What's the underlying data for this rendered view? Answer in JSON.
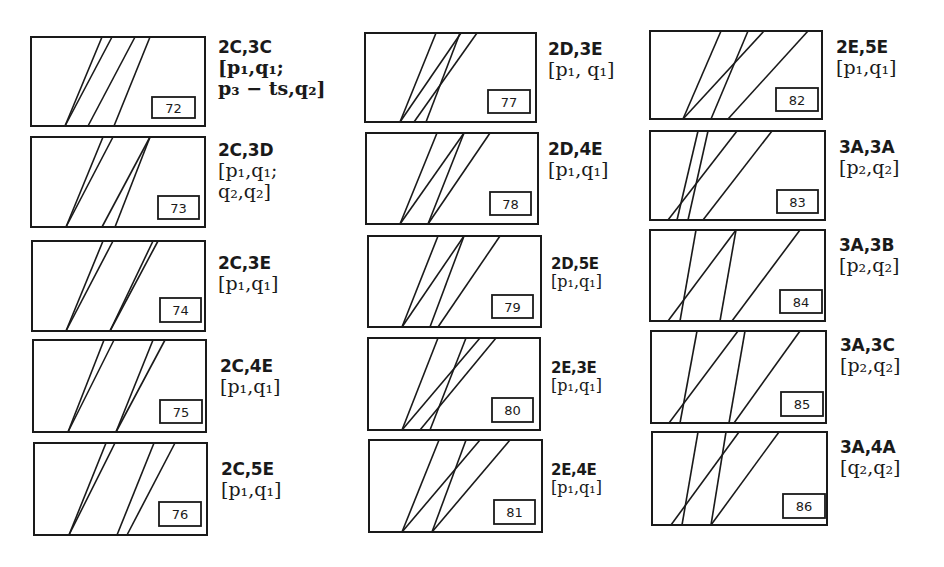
{
  "figure": {
    "background": "#ffffff",
    "stroke_color": "#1a1a1a"
  },
  "panels": [
    {
      "number": "72",
      "box": [
        31,
        37,
        205,
        126
      ],
      "numbox": [
        152,
        97,
        195,
        118
      ],
      "lines": [
        [
          65,
          126,
          102,
          37
        ],
        [
          65,
          126,
          112,
          37
        ],
        [
          88,
          126,
          135,
          37
        ],
        [
          114,
          126,
          150,
          37
        ]
      ],
      "label": {
        "x": 218,
        "y": 38,
        "code": "2C,3C",
        "params": [
          "[p₁,q₁;",
          "p₃ − ts,q₂]"
        ],
        "style": "bold"
      }
    },
    {
      "number": "73",
      "box": [
        31,
        137,
        205,
        227
      ],
      "numbox": [
        158,
        196,
        199,
        219
      ],
      "lines": [
        [
          66,
          227,
          103,
          137
        ],
        [
          66,
          227,
          113,
          137
        ],
        [
          102,
          227,
          150,
          137
        ],
        [
          115,
          227,
          150,
          137
        ]
      ],
      "label": {
        "x": 218,
        "y": 141,
        "code": "2C,3D",
        "params": [
          "[p₁,q₁;",
          "q₂,q₂]"
        ],
        "style": "normal"
      }
    },
    {
      "number": "74",
      "box": [
        32,
        241,
        205,
        331
      ],
      "numbox": [
        160,
        298,
        201,
        322
      ],
      "lines": [
        [
          66,
          331,
          103,
          241
        ],
        [
          66,
          331,
          113,
          241
        ],
        [
          110,
          331,
          153,
          241
        ],
        [
          110,
          331,
          158,
          241
        ]
      ],
      "label": {
        "x": 218,
        "y": 254,
        "code": "2C,3E",
        "params": [
          "[p₁,q₁]"
        ],
        "style": "normal"
      }
    },
    {
      "number": "75",
      "box": [
        33,
        340,
        206,
        432
      ],
      "numbox": [
        160,
        400,
        202,
        423
      ],
      "lines": [
        [
          68,
          432,
          104,
          340
        ],
        [
          68,
          432,
          114,
          340
        ],
        [
          116,
          432,
          153,
          340
        ],
        [
          116,
          432,
          165,
          340
        ]
      ],
      "label": {
        "x": 220,
        "y": 357,
        "code": "2C,4E",
        "params": [
          "[p₁,q₁]"
        ],
        "style": "normal"
      }
    },
    {
      "number": "76",
      "box": [
        34,
        443,
        207,
        535
      ],
      "numbox": [
        159,
        502,
        201,
        526
      ],
      "lines": [
        [
          69,
          535,
          106,
          443
        ],
        [
          69,
          535,
          115,
          443
        ],
        [
          117,
          535,
          154,
          443
        ],
        [
          127,
          535,
          175,
          443
        ]
      ],
      "label": {
        "x": 221,
        "y": 460,
        "code": "2C,5E",
        "params": [
          "[p₁,q₁]"
        ],
        "style": "normal"
      }
    },
    {
      "number": "77",
      "box": [
        365,
        33,
        536,
        122
      ],
      "numbox": [
        488,
        90,
        530,
        113
      ],
      "lines": [
        [
          400,
          122,
          436,
          33
        ],
        [
          400,
          122,
          461,
          33
        ],
        [
          414,
          122,
          477,
          33
        ],
        [
          426,
          122,
          460,
          33
        ]
      ],
      "label": {
        "x": 548,
        "y": 40,
        "code": "2D,3E",
        "params": [
          "[p₁, q₁]"
        ],
        "style": "normal"
      }
    },
    {
      "number": "78",
      "box": [
        366,
        133,
        538,
        224
      ],
      "numbox": [
        490,
        192,
        531,
        215
      ],
      "lines": [
        [
          400,
          224,
          437,
          133
        ],
        [
          400,
          224,
          464,
          133
        ],
        [
          428,
          224,
          464,
          133
        ],
        [
          428,
          224,
          490,
          133
        ]
      ],
      "label": {
        "x": 548,
        "y": 140,
        "code": "2D,4E",
        "params": [
          "[p₁,q₁]"
        ],
        "style": "normal"
      }
    },
    {
      "number": "79",
      "box": [
        368,
        236,
        541,
        327
      ],
      "numbox": [
        492,
        295,
        533,
        318
      ],
      "lines": [
        [
          402,
          327,
          438,
          236
        ],
        [
          402,
          327,
          464,
          236
        ],
        [
          430,
          327,
          464,
          236
        ],
        [
          438,
          327,
          500,
          236
        ]
      ],
      "label": {
        "x": 551,
        "y": 256,
        "code": "2D,5E",
        "params": [
          "[p₁,q₁]"
        ],
        "style": "small"
      }
    },
    {
      "number": "80",
      "box": [
        368,
        338,
        540,
        430
      ],
      "numbox": [
        492,
        398,
        533,
        422
      ],
      "lines": [
        [
          402,
          430,
          438,
          338
        ],
        [
          402,
          430,
          480,
          338
        ],
        [
          420,
          430,
          496,
          338
        ],
        [
          430,
          430,
          466,
          338
        ]
      ],
      "label": {
        "x": 551,
        "y": 360,
        "code": "2E,3E",
        "params": [
          "[p₁,q₁]"
        ],
        "style": "small"
      }
    },
    {
      "number": "81",
      "box": [
        369,
        440,
        542,
        532
      ],
      "numbox": [
        494,
        500,
        535,
        524
      ],
      "lines": [
        [
          402,
          532,
          439,
          440
        ],
        [
          402,
          532,
          480,
          440
        ],
        [
          432,
          532,
          466,
          440
        ],
        [
          432,
          532,
          510,
          440
        ]
      ],
      "label": {
        "x": 551,
        "y": 462,
        "code": "2E,4E",
        "params": [
          "[p₁,q₁]"
        ],
        "style": "small"
      }
    },
    {
      "number": "82",
      "box": [
        650,
        31,
        822,
        119
      ],
      "numbox": [
        776,
        88,
        818,
        111
      ],
      "lines": [
        [
          683,
          119,
          721,
          31
        ],
        [
          683,
          119,
          764,
          31
        ],
        [
          711,
          119,
          748,
          31
        ],
        [
          728,
          119,
          808,
          31
        ]
      ],
      "label": {
        "x": 836,
        "y": 38,
        "code": "2E,5E",
        "params": [
          "[p₁,q₁]"
        ],
        "style": "normal"
      }
    },
    {
      "number": "83",
      "box": [
        650,
        131,
        825,
        220
      ],
      "numbox": [
        777,
        190,
        818,
        213
      ],
      "lines": [
        [
          668,
          220,
          737,
          131
        ],
        [
          677,
          220,
          698,
          131
        ],
        [
          688,
          220,
          708,
          131
        ],
        [
          703,
          220,
          772,
          131
        ]
      ],
      "label": {
        "x": 839,
        "y": 138,
        "code": "3A,3A",
        "params": [
          "[p₂,q₂]"
        ],
        "style": "normal"
      }
    },
    {
      "number": "84",
      "box": [
        650,
        230,
        825,
        321
      ],
      "numbox": [
        780,
        290,
        822,
        313
      ],
      "lines": [
        [
          668,
          321,
          736,
          230
        ],
        [
          680,
          321,
          696,
          230
        ],
        [
          720,
          321,
          736,
          230
        ],
        [
          732,
          321,
          800,
          230
        ]
      ],
      "label": {
        "x": 839,
        "y": 236,
        "code": "3A,3B",
        "params": [
          "[p₂,q₂]"
        ],
        "style": "normal"
      }
    },
    {
      "number": "85",
      "box": [
        651,
        331,
        826,
        423
      ],
      "numbox": [
        781,
        392,
        823,
        416
      ],
      "lines": [
        [
          669,
          423,
          738,
          331
        ],
        [
          680,
          423,
          697,
          331
        ],
        [
          729,
          423,
          745,
          331
        ],
        [
          734,
          423,
          800,
          331
        ]
      ],
      "label": {
        "x": 840,
        "y": 336,
        "code": "3A,3C",
        "params": [
          "[p₂,q₂]"
        ],
        "style": "normal"
      }
    },
    {
      "number": "86",
      "box": [
        652,
        432,
        827,
        525
      ],
      "numbox": [
        783,
        494,
        825,
        518
      ],
      "lines": [
        [
          671,
          525,
          739,
          432
        ],
        [
          682,
          525,
          698,
          432
        ],
        [
          711,
          525,
          726,
          432
        ],
        [
          711,
          525,
          779,
          432
        ]
      ],
      "label": {
        "x": 840,
        "y": 438,
        "code": "3A,4A",
        "params": [
          "[q₂,q₂]"
        ],
        "style": "normal"
      }
    }
  ]
}
